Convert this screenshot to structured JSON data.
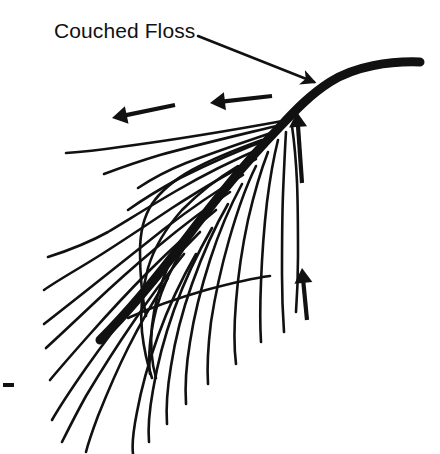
{
  "figure": {
    "title": "Couched Floss",
    "background_color": "#ffffff",
    "ink_color": "#111111",
    "width": 440,
    "height": 454
  },
  "labels": [
    {
      "id": "couched-floss",
      "text": "Couched Floss",
      "x": 54,
      "y": 20,
      "font_size": 21
    }
  ],
  "annotations": {
    "leader_arrow": {
      "name": "leader-arrow-to-shaft",
      "from": [
        198,
        36
      ],
      "to": [
        314,
        82
      ],
      "direction": "down-right"
    },
    "direction_arrows": [
      {
        "name": "direction-arrow-left-upper",
        "from": [
          175,
          105
        ],
        "to": [
          112,
          118
        ],
        "direction": "left"
      },
      {
        "name": "direction-arrow-left-lower",
        "from": [
          272,
          96
        ],
        "to": [
          210,
          103
        ],
        "direction": "left"
      },
      {
        "name": "direction-arrow-up-upper",
        "from": [
          302,
          183
        ],
        "to": [
          297,
          112
        ],
        "direction": "up"
      },
      {
        "name": "direction-arrow-up-lower",
        "from": [
          307,
          320
        ],
        "to": [
          302,
          268
        ],
        "direction": "up"
      }
    ],
    "tick_mark": {
      "name": "left-edge-tick-mark",
      "x": 3,
      "y": 383,
      "width": 11,
      "height": 4
    }
  },
  "shaft": {
    "name": "couched-floss-shaft",
    "stroke_width": 9,
    "path": "M 420 62 C 390 61, 355 66, 330 82 C 308 96, 292 114, 275 132 C 250 158, 215 200, 185 240 C 155 280, 125 315, 100 340",
    "start": [
      420,
      62
    ],
    "end": [
      100,
      340
    ]
  },
  "barbs": {
    "name": "feather-barbs",
    "stroke_width": 2.6,
    "left_side_count": 12,
    "right_side_count": 9,
    "left_paths": [
      "M 288 120 C 250 127, 180 139, 120 147 C 100 150, 82 152, 66 153",
      "M 284 124 C 248 133, 200 144, 160 155 C 140 161, 120 168, 104 174",
      "M 280 130 C 250 140, 215 152, 186 163 C 166 171, 150 180, 138 188",
      "M 274 137 C 245 148, 210 163, 180 178 C 160 189, 142 200, 128 210",
      "M 266 146 C 238 158, 205 174, 176 191 C 152 205, 128 220, 108 232 C 90 242, 70 250, 48 257",
      "M 256 159 C 230 172, 200 190, 172 208 C 148 224, 124 240, 102 254 C 80 268, 58 280, 44 290",
      "M 243 175 C 218 190, 190 209, 164 229 C 140 248, 116 267, 96 283 C 76 299, 58 313, 44 324",
      "M 230 192 C 206 208, 180 228, 156 248 C 132 268, 110 288, 92 305 C 74 322, 58 337, 46 348",
      "M 216 210 C 194 228, 170 250, 148 272 C 126 294, 106 316, 90 334 C 74 352, 60 368, 50 380",
      "M 200 232 C 180 252, 158 276, 138 300 C 118 324, 100 348, 86 368 C 72 388, 60 406, 52 420",
      "M 184 254 C 166 276, 148 300, 132 324 C 114 350, 98 376, 86 396 C 76 414, 68 430, 62 442",
      "M 168 278 C 154 300, 140 324, 128 348 C 116 372, 106 396, 98 416 C 92 432, 88 444, 86 452"
    ],
    "right_paths": [
      "M 292 126 C 294 140, 296 160, 297 182 C 298 206, 298 232, 298 256 C 298 280, 297 298, 296 312",
      "M 286 132 C 285 148, 284 170, 283 194 C 282 220, 282 248, 282 274 C 282 298, 283 318, 284 332",
      "M 278 140 C 274 156, 270 178, 267 202 C 264 228, 262 256, 261 282 C 260 306, 260 326, 261 342",
      "M 268 152 C 261 170, 254 194, 248 220 C 242 248, 238 276, 236 302 C 234 326, 234 348, 236 364",
      "M 256 166 C 246 186, 237 212, 229 240 C 221 268, 215 296, 211 322 C 208 346, 207 368, 208 384",
      "M 242 184 C 230 206, 219 232, 210 260 C 201 288, 194 316, 190 342 C 186 366, 185 388, 186 404",
      "M 228 204 C 214 228, 202 256, 192 284 C 182 312, 175 340, 171 366 C 167 390, 166 410, 167 424",
      "M 212 228 C 197 254, 184 282, 174 310 C 164 338, 157 366, 153 390 C 149 412, 148 430, 149 442",
      "M 196 254 C 181 280, 168 308, 158 336 C 148 364, 141 390, 137 412 C 133 432, 132 446, 133 454"
    ],
    "cross_paths": [
      "M 262 140 C 240 148, 214 158, 192 170 C 174 180, 160 192, 152 204 C 144 216, 140 232, 140 252 C 140 274, 142 296, 146 316",
      "M 238 166 C 218 178, 198 194, 182 210 C 166 228, 154 248, 148 268 C 142 290, 140 312, 142 332 C 144 350, 148 366, 152 378",
      "M 210 206 C 194 222, 180 242, 170 262 C 160 284, 154 306, 152 326 C 150 346, 152 364, 156 378",
      "M 184 248 C 172 266, 162 288, 156 310 C 150 334, 148 356, 150 374",
      "M 128 318 C 150 308, 178 298, 206 290 C 232 283, 254 278, 270 276"
    ]
  }
}
